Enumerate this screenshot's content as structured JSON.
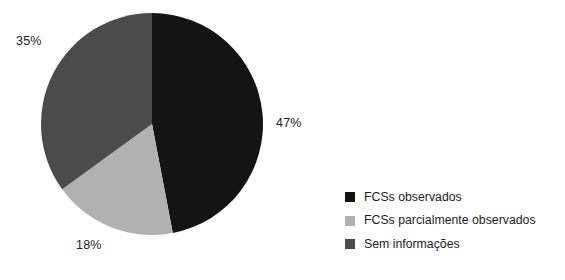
{
  "chart_data": {
    "type": "pie",
    "title": "",
    "subtitle": "",
    "xlabel": "",
    "ylabel": "",
    "grid": false,
    "legend_position": "right-bottom",
    "start_angle_deg": 0,
    "direction": "clockwise",
    "categories": [
      "FCSs observados",
      "FCSs parcialmente observados",
      "Sem informações"
    ],
    "values": [
      47,
      18,
      35
    ],
    "value_unit": "%",
    "data_labels": [
      "47%",
      "18%",
      "35%"
    ],
    "colors": [
      "#141414",
      "#b1b1b1",
      "#4b4b4b"
    ],
    "slices": [
      {
        "label": "FCSs observados",
        "value": 47,
        "data_label": "47%",
        "color": "#141414",
        "start_deg": 0,
        "end_deg": 169.2,
        "label_position": "right"
      },
      {
        "label": "FCSs parcialmente observados",
        "value": 18,
        "data_label": "18%",
        "color": "#b1b1b1",
        "start_deg": 169.2,
        "end_deg": 234.0,
        "label_position": "bottom-left"
      },
      {
        "label": "Sem informações",
        "value": 35,
        "data_label": "35%",
        "color": "#4b4b4b",
        "start_deg": 234.0,
        "end_deg": 360.0,
        "label_position": "top-left"
      }
    ]
  },
  "labels": {
    "pct_black": "47%",
    "pct_darkgray": "35%",
    "pct_lightgray": "18%"
  },
  "legend": {
    "items": [
      {
        "label": "FCSs observados",
        "color": "#141414"
      },
      {
        "label": "FCSs parcialmente observados",
        "color": "#b1b1b1"
      },
      {
        "label": "Sem informações",
        "color": "#4b4b4b"
      }
    ]
  }
}
